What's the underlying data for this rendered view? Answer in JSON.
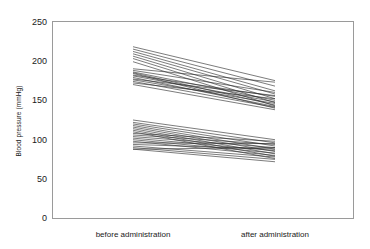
{
  "chart_data": {
    "type": "line",
    "title": "",
    "xlabel": "",
    "ylabel": "Blood pressure (mmHg)",
    "categories": [
      "before administration",
      "after administration"
    ],
    "x": [
      0,
      1
    ],
    "ylim": [
      0,
      250
    ],
    "yticks": [
      0,
      50,
      100,
      150,
      200,
      250
    ],
    "ytick_labels": [
      "0",
      "50",
      "100",
      "150",
      "200",
      "250"
    ],
    "grid": false,
    "legend": "none",
    "line_color": "#2b2b2b",
    "frame_color": "#9a9a9a",
    "series": [
      {
        "name": "subject-01",
        "values": [
          218,
          175
        ]
      },
      {
        "name": "subject-02",
        "values": [
          215,
          168
        ]
      },
      {
        "name": "subject-03",
        "values": [
          212,
          162
        ]
      },
      {
        "name": "subject-04",
        "values": [
          209,
          158
        ]
      },
      {
        "name": "subject-05",
        "values": [
          206,
          152
        ]
      },
      {
        "name": "subject-06",
        "values": [
          203,
          147
        ]
      },
      {
        "name": "subject-07",
        "values": [
          199,
          143
        ]
      },
      {
        "name": "subject-08",
        "values": [
          190,
          173
        ]
      },
      {
        "name": "subject-09",
        "values": [
          188,
          160
        ]
      },
      {
        "name": "subject-10",
        "values": [
          186,
          150
        ]
      },
      {
        "name": "subject-11",
        "values": [
          185,
          144
        ]
      },
      {
        "name": "subject-12",
        "values": [
          184,
          140
        ]
      },
      {
        "name": "subject-13",
        "values": [
          182,
          155
        ]
      },
      {
        "name": "subject-14",
        "values": [
          181,
          148
        ]
      },
      {
        "name": "subject-15",
        "values": [
          179,
          142
        ]
      },
      {
        "name": "subject-16",
        "values": [
          177,
          156
        ]
      },
      {
        "name": "subject-17",
        "values": [
          176,
          146
        ]
      },
      {
        "name": "subject-18",
        "values": [
          174,
          141
        ]
      },
      {
        "name": "subject-19",
        "values": [
          172,
          152
        ]
      },
      {
        "name": "subject-20",
        "values": [
          170,
          138
        ]
      },
      {
        "name": "subject-21",
        "values": [
          125,
          100
        ]
      },
      {
        "name": "subject-22",
        "values": [
          122,
          96
        ]
      },
      {
        "name": "subject-23",
        "values": [
          120,
          92
        ]
      },
      {
        "name": "subject-24",
        "values": [
          118,
          88
        ]
      },
      {
        "name": "subject-25",
        "values": [
          116,
          85
        ]
      },
      {
        "name": "subject-26",
        "values": [
          114,
          82
        ]
      },
      {
        "name": "subject-27",
        "values": [
          112,
          79
        ]
      },
      {
        "name": "subject-28",
        "values": [
          110,
          76
        ]
      },
      {
        "name": "subject-29",
        "values": [
          108,
          98
        ]
      },
      {
        "name": "subject-30",
        "values": [
          106,
          94
        ]
      },
      {
        "name": "subject-31",
        "values": [
          104,
          90
        ]
      },
      {
        "name": "subject-32",
        "values": [
          102,
          86
        ]
      },
      {
        "name": "subject-33",
        "values": [
          100,
          83
        ]
      },
      {
        "name": "subject-34",
        "values": [
          98,
          80
        ]
      },
      {
        "name": "subject-35",
        "values": [
          96,
          95
        ]
      },
      {
        "name": "subject-36",
        "values": [
          94,
          88
        ]
      },
      {
        "name": "subject-37",
        "values": [
          92,
          78
        ]
      },
      {
        "name": "subject-38",
        "values": [
          90,
          75
        ]
      },
      {
        "name": "subject-39",
        "values": [
          88,
          72
        ]
      },
      {
        "name": "subject-40",
        "values": [
          88,
          90
        ]
      }
    ]
  },
  "axes": {
    "y_title": "Blood pressure (mmHg)",
    "tick_0": "0",
    "tick_50": "50",
    "tick_100": "100",
    "tick_150": "150",
    "tick_200": "200",
    "tick_250": "250"
  },
  "categories": {
    "before": "before administration",
    "after": "after administration"
  }
}
